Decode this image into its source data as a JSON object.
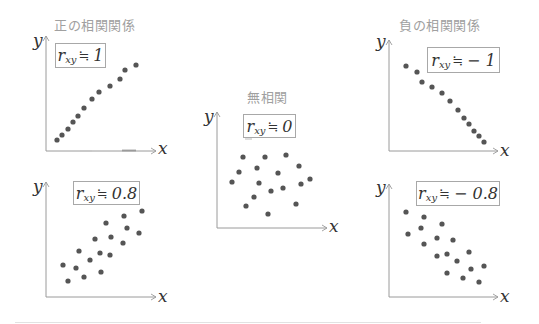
{
  "chart_data": [
    {
      "type": "scatter",
      "title": "正の相関関係",
      "annotation": "r_xy ≒ 1",
      "xlabel": "x",
      "ylabel": "y",
      "grid": false,
      "points": [
        [
          57,
          140
        ],
        [
          62,
          135
        ],
        [
          68,
          129
        ],
        [
          73,
          122
        ],
        [
          78,
          116
        ],
        [
          84,
          108
        ],
        [
          92,
          99
        ],
        [
          99,
          92
        ],
        [
          110,
          86
        ],
        [
          120,
          79
        ],
        [
          125,
          70
        ],
        [
          136,
          65
        ]
      ]
    },
    {
      "type": "scatter",
      "title": "",
      "annotation": "r_xy ≒ 0.8",
      "xlabel": "x",
      "ylabel": "y",
      "grid": false,
      "points": [
        [
          63,
          265
        ],
        [
          68,
          281
        ],
        [
          76,
          268
        ],
        [
          79,
          251
        ],
        [
          84,
          277
        ],
        [
          90,
          260
        ],
        [
          95,
          239
        ],
        [
          100,
          253
        ],
        [
          101,
          272
        ],
        [
          106,
          223
        ],
        [
          111,
          237
        ],
        [
          110,
          255
        ],
        [
          124,
          216
        ],
        [
          127,
          228
        ],
        [
          123,
          243
        ],
        [
          139,
          233
        ],
        [
          142,
          211
        ]
      ]
    },
    {
      "type": "scatter",
      "title": "無相関",
      "annotation": "r_xy ≒ 0",
      "xlabel": "x",
      "ylabel": "y",
      "grid": false,
      "points": [
        [
          243,
          157
        ],
        [
          265,
          157
        ],
        [
          286,
          155
        ],
        [
          299,
          166
        ],
        [
          239,
          172
        ],
        [
          257,
          168
        ],
        [
          278,
          173
        ],
        [
          232,
          182
        ],
        [
          259,
          183
        ],
        [
          301,
          184
        ],
        [
          310,
          179
        ],
        [
          271,
          191
        ],
        [
          283,
          188
        ],
        [
          254,
          197
        ],
        [
          246,
          206
        ],
        [
          296,
          204
        ],
        [
          268,
          214
        ]
      ]
    },
    {
      "type": "scatter",
      "title": "負の相関関係",
      "annotation": "r_xy ≒ −1",
      "xlabel": "x",
      "ylabel": "y",
      "grid": false,
      "points": [
        [
          406,
          66
        ],
        [
          417,
          72
        ],
        [
          422,
          82
        ],
        [
          432,
          87
        ],
        [
          442,
          93
        ],
        [
          450,
          101
        ],
        [
          458,
          110
        ],
        [
          464,
          118
        ],
        [
          469,
          124
        ],
        [
          474,
          131
        ],
        [
          479,
          136
        ],
        [
          484,
          142
        ]
      ]
    },
    {
      "type": "scatter",
      "title": "",
      "annotation": "r_xy ≒ −0.8",
      "xlabel": "x",
      "ylabel": "y",
      "grid": false,
      "points": [
        [
          406,
          212
        ],
        [
          424,
          217
        ],
        [
          442,
          224
        ],
        [
          421,
          228
        ],
        [
          408,
          234
        ],
        [
          437,
          238
        ],
        [
          453,
          240
        ],
        [
          424,
          244
        ],
        [
          437,
          256
        ],
        [
          447,
          254
        ],
        [
          469,
          252
        ],
        [
          457,
          261
        ],
        [
          471,
          269
        ],
        [
          484,
          266
        ],
        [
          447,
          273
        ],
        [
          463,
          278
        ],
        [
          479,
          282
        ]
      ]
    }
  ],
  "titles": {
    "positive": "正の相関関係",
    "none": "無相関",
    "negative": "負の相関関係"
  },
  "labels": {
    "r": "r",
    "sub": "xy",
    "approx": "≒",
    "pos1": "1",
    "pos08": "0.8",
    "zero": "0",
    "neg1": "− 1",
    "neg08": "− 0.8",
    "x": "x",
    "y": "y"
  },
  "colors": {
    "axis": "#9a9a9a",
    "dot": "#555555",
    "title": "#a0a0a0",
    "box_border": "#a8a8a8"
  }
}
